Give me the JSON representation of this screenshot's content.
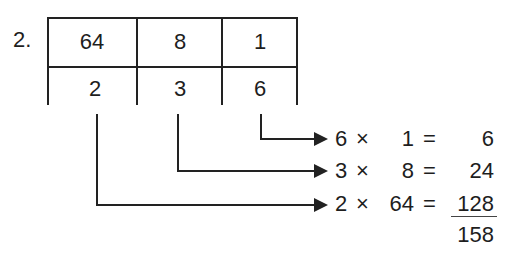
{
  "problem": {
    "number_label": "2.",
    "place_values": [
      "64",
      "8",
      "1"
    ],
    "digits": [
      "2",
      "3",
      "6"
    ],
    "equations": [
      {
        "digit": "6",
        "times": "×",
        "place_value": "1",
        "equals": "=",
        "product": "6"
      },
      {
        "digit": "3",
        "times": "×",
        "place_value": "8",
        "equals": "=",
        "product": "24"
      },
      {
        "digit": "2",
        "times": "×",
        "place_value": "64",
        "equals": "=",
        "product": "128"
      }
    ],
    "total": "158"
  }
}
